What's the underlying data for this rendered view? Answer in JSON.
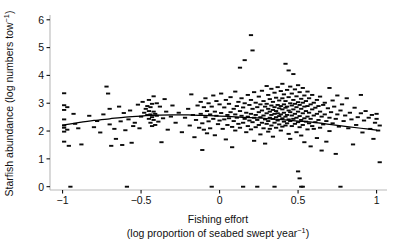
{
  "chart_data": {
    "type": "scatter",
    "title": "",
    "xlabel_line1": "Fishing effort",
    "xlabel_line2_pre": "(log proportion of seabed swept year",
    "xlabel_line2_sup": "−1",
    "xlabel_line2_post": ")",
    "ylabel_pre": "Starfish abundance (log numbers tow",
    "ylabel_sup": "−1",
    "ylabel_post": ")",
    "xlim": [
      -1.08,
      1.06
    ],
    "ylim": [
      -0.12,
      6.1
    ],
    "xticks": [
      -1,
      -0.5,
      0,
      0.5,
      1
    ],
    "xticklabels": [
      "−1",
      "−0.5",
      "0",
      "0.5",
      "1"
    ],
    "yticks": [
      0,
      1,
      2,
      3,
      4,
      5,
      6
    ],
    "yticklabels": [
      "0",
      "1",
      "2",
      "3",
      "4",
      "5",
      "6"
    ],
    "grid": false,
    "legend": "none",
    "marker_style": "horizontal-dash",
    "marker_color": "#0b0b0b",
    "axis_color": "#b9b9b9",
    "curve_color": "#000000",
    "fit_curve_note": "smooth fitted line: rises from ~2.2 at x=-1 to a shallow peak ~2.6 near x=-0.25 then declines to ~2.0 at x=1",
    "fit_curve": [
      [
        -1.0,
        2.21
      ],
      [
        -0.9,
        2.3
      ],
      [
        -0.8,
        2.38
      ],
      [
        -0.7,
        2.44
      ],
      [
        -0.6,
        2.5
      ],
      [
        -0.5,
        2.54
      ],
      [
        -0.4,
        2.57
      ],
      [
        -0.3,
        2.58
      ],
      [
        -0.2,
        2.58
      ],
      [
        -0.1,
        2.56
      ],
      [
        0.0,
        2.54
      ],
      [
        0.1,
        2.51
      ],
      [
        0.2,
        2.48
      ],
      [
        0.3,
        2.45
      ],
      [
        0.4,
        2.41
      ],
      [
        0.5,
        2.36
      ],
      [
        0.6,
        2.31
      ],
      [
        0.7,
        2.24
      ],
      [
        0.8,
        2.17
      ],
      [
        0.9,
        2.1
      ],
      [
        1.0,
        2.03
      ]
    ],
    "points": [
      [
        -0.99,
        3.36
      ],
      [
        -0.99,
        2.93
      ],
      [
        -0.99,
        2.76
      ],
      [
        -0.99,
        2.42
      ],
      [
        -0.99,
        2.2
      ],
      [
        -0.99,
        2.12
      ],
      [
        -0.99,
        1.98
      ],
      [
        -0.99,
        1.62
      ],
      [
        -0.97,
        2.86
      ],
      [
        -0.97,
        2.05
      ],
      [
        -0.96,
        1.47
      ],
      [
        -0.95,
        0.0
      ],
      [
        -0.93,
        2.62
      ],
      [
        -0.92,
        2.26
      ],
      [
        -0.9,
        2.1
      ],
      [
        -0.88,
        1.52
      ],
      [
        -0.83,
        2.55
      ],
      [
        -0.8,
        2.14
      ],
      [
        -0.78,
        2.36
      ],
      [
        -0.76,
        1.95
      ],
      [
        -0.74,
        2.6
      ],
      [
        -0.72,
        3.6
      ],
      [
        -0.71,
        3.35
      ],
      [
        -0.7,
        2.8
      ],
      [
        -0.7,
        2.24
      ],
      [
        -0.69,
        1.47
      ],
      [
        -0.67,
        2.08
      ],
      [
        -0.66,
        1.72
      ],
      [
        -0.64,
        2.88
      ],
      [
        -0.63,
        2.35
      ],
      [
        -0.62,
        1.5
      ],
      [
        -0.61,
        2.65
      ],
      [
        -0.6,
        2.03
      ],
      [
        -0.59,
        0.0
      ],
      [
        -0.58,
        2.42
      ],
      [
        -0.57,
        2.74
      ],
      [
        -0.56,
        1.58
      ],
      [
        -0.55,
        2.18
      ],
      [
        -0.54,
        2.3
      ],
      [
        -0.52,
        2.95
      ],
      [
        -0.51,
        2.1
      ],
      [
        -0.5,
        2.52
      ],
      [
        -0.49,
        3.05
      ],
      [
        -0.48,
        2.66
      ],
      [
        -0.47,
        2.8
      ],
      [
        -0.46,
        2.9
      ],
      [
        -0.46,
        2.58
      ],
      [
        -0.45,
        3.12
      ],
      [
        -0.45,
        2.72
      ],
      [
        -0.45,
        2.44
      ],
      [
        -0.44,
        2.86
      ],
      [
        -0.44,
        2.6
      ],
      [
        -0.44,
        2.3
      ],
      [
        -0.43,
        2.98
      ],
      [
        -0.43,
        2.5
      ],
      [
        -0.43,
        2.18
      ],
      [
        -0.42,
        3.25
      ],
      [
        -0.42,
        2.7
      ],
      [
        -0.42,
        2.4
      ],
      [
        -0.41,
        2.62
      ],
      [
        -0.41,
        2.22
      ],
      [
        -0.4,
        3.0
      ],
      [
        -0.4,
        2.55
      ],
      [
        -0.39,
        2.34
      ],
      [
        -0.38,
        2.88
      ],
      [
        -0.37,
        1.6
      ],
      [
        -0.36,
        2.46
      ],
      [
        -0.35,
        3.15
      ],
      [
        -0.34,
        2.7
      ],
      [
        -0.33,
        2.05
      ],
      [
        -0.31,
        2.52
      ],
      [
        -0.3,
        2.92
      ],
      [
        -0.28,
        2.3
      ],
      [
        -0.26,
        2.66
      ],
      [
        -0.24,
        1.96
      ],
      [
        -0.22,
        2.48
      ],
      [
        -0.2,
        2.8
      ],
      [
        -0.19,
        2.2
      ],
      [
        -0.18,
        3.32
      ],
      [
        -0.17,
        2.58
      ],
      [
        -0.16,
        1.78
      ],
      [
        -0.15,
        2.4
      ],
      [
        -0.14,
        2.92
      ],
      [
        -0.13,
        2.12
      ],
      [
        -0.12,
        3.05
      ],
      [
        -0.12,
        2.62
      ],
      [
        -0.11,
        2.28
      ],
      [
        -0.11,
        1.32
      ],
      [
        -0.1,
        2.86
      ],
      [
        -0.1,
        2.05
      ],
      [
        -0.09,
        3.18
      ],
      [
        -0.09,
        2.5
      ],
      [
        -0.08,
        2.72
      ],
      [
        -0.08,
        1.92
      ],
      [
        -0.07,
        3.0
      ],
      [
        -0.07,
        2.35
      ],
      [
        -0.06,
        2.6
      ],
      [
        -0.06,
        2.1
      ],
      [
        -0.05,
        2.88
      ],
      [
        -0.05,
        0.0
      ],
      [
        -0.04,
        3.28
      ],
      [
        -0.04,
        2.44
      ],
      [
        -0.03,
        2.7
      ],
      [
        -0.03,
        1.85
      ],
      [
        -0.02,
        3.08
      ],
      [
        -0.02,
        2.55
      ],
      [
        -0.01,
        2.25
      ],
      [
        0.0,
        2.96
      ],
      [
        0.0,
        2.38
      ],
      [
        0.01,
        3.35
      ],
      [
        0.01,
        2.65
      ],
      [
        0.02,
        2.08
      ],
      [
        0.03,
        2.85
      ],
      [
        0.03,
        2.42
      ],
      [
        0.04,
        3.12
      ],
      [
        0.04,
        1.7
      ],
      [
        0.05,
        2.58
      ],
      [
        0.05,
        2.22
      ],
      [
        0.06,
        2.98
      ],
      [
        0.06,
        2.46
      ],
      [
        0.07,
        3.22
      ],
      [
        0.07,
        2.68
      ],
      [
        0.08,
        2.15
      ],
      [
        0.08,
        1.42
      ],
      [
        0.09,
        2.8
      ],
      [
        0.09,
        2.36
      ],
      [
        0.1,
        3.42
      ],
      [
        0.1,
        2.6
      ],
      [
        0.1,
        2.02
      ],
      [
        0.11,
        2.9
      ],
      [
        0.11,
        2.48
      ],
      [
        0.12,
        3.05
      ],
      [
        0.12,
        2.26
      ],
      [
        0.13,
        4.28
      ],
      [
        0.13,
        2.72
      ],
      [
        0.13,
        2.12
      ],
      [
        0.14,
        3.18
      ],
      [
        0.14,
        2.55
      ],
      [
        0.15,
        2.85
      ],
      [
        0.15,
        2.3
      ],
      [
        0.15,
        0.0
      ],
      [
        0.16,
        4.55
      ],
      [
        0.16,
        3.0
      ],
      [
        0.16,
        2.44
      ],
      [
        0.17,
        2.66
      ],
      [
        0.17,
        1.96
      ],
      [
        0.18,
        3.3
      ],
      [
        0.18,
        2.52
      ],
      [
        0.18,
        2.18
      ],
      [
        0.19,
        2.94
      ],
      [
        0.19,
        2.38
      ],
      [
        0.2,
        5.45
      ],
      [
        0.2,
        3.12
      ],
      [
        0.2,
        2.62
      ],
      [
        0.2,
        2.06
      ],
      [
        0.21,
        4.9
      ],
      [
        0.21,
        2.8
      ],
      [
        0.21,
        2.32
      ],
      [
        0.22,
        3.4
      ],
      [
        0.22,
        2.48
      ],
      [
        0.22,
        1.65
      ],
      [
        0.23,
        3.02
      ],
      [
        0.23,
        2.58
      ],
      [
        0.23,
        2.14
      ],
      [
        0.24,
        2.86
      ],
      [
        0.24,
        2.4
      ],
      [
        0.24,
        0.0
      ],
      [
        0.25,
        3.24
      ],
      [
        0.25,
        2.68
      ],
      [
        0.25,
        2.22
      ],
      [
        0.26,
        2.96
      ],
      [
        0.26,
        2.5
      ],
      [
        0.26,
        1.88
      ],
      [
        0.27,
        3.45
      ],
      [
        0.27,
        2.74
      ],
      [
        0.27,
        2.3
      ],
      [
        0.28,
        3.08
      ],
      [
        0.28,
        2.56
      ],
      [
        0.28,
        2.1
      ],
      [
        0.29,
        2.88
      ],
      [
        0.29,
        2.42
      ],
      [
        0.29,
        1.55
      ],
      [
        0.3,
        3.62
      ],
      [
        0.3,
        2.98
      ],
      [
        0.3,
        2.64
      ],
      [
        0.3,
        2.26
      ],
      [
        0.31,
        3.3
      ],
      [
        0.31,
        2.8
      ],
      [
        0.31,
        2.36
      ],
      [
        0.31,
        1.98
      ],
      [
        0.32,
        3.15
      ],
      [
        0.32,
        2.7
      ],
      [
        0.32,
        2.48
      ],
      [
        0.32,
        2.08
      ],
      [
        0.33,
        3.52
      ],
      [
        0.33,
        2.92
      ],
      [
        0.33,
        2.58
      ],
      [
        0.33,
        2.2
      ],
      [
        0.34,
        3.05
      ],
      [
        0.34,
        2.76
      ],
      [
        0.34,
        2.44
      ],
      [
        0.34,
        1.8
      ],
      [
        0.35,
        3.38
      ],
      [
        0.35,
        2.86
      ],
      [
        0.35,
        2.62
      ],
      [
        0.35,
        2.3
      ],
      [
        0.35,
        0.0
      ],
      [
        0.36,
        3.2
      ],
      [
        0.36,
        2.72
      ],
      [
        0.36,
        2.5
      ],
      [
        0.36,
        2.12
      ],
      [
        0.37,
        3.58
      ],
      [
        0.37,
        2.94
      ],
      [
        0.37,
        2.64
      ],
      [
        0.37,
        2.38
      ],
      [
        0.38,
        3.1
      ],
      [
        0.38,
        2.82
      ],
      [
        0.38,
        2.54
      ],
      [
        0.38,
        2.24
      ],
      [
        0.39,
        3.44
      ],
      [
        0.39,
        2.9
      ],
      [
        0.39,
        2.6
      ],
      [
        0.39,
        2.02
      ],
      [
        0.4,
        3.7
      ],
      [
        0.4,
        3.18
      ],
      [
        0.4,
        2.78
      ],
      [
        0.4,
        2.46
      ],
      [
        0.4,
        2.16
      ],
      [
        0.41,
        3.32
      ],
      [
        0.41,
        2.96
      ],
      [
        0.41,
        2.66
      ],
      [
        0.41,
        2.34
      ],
      [
        0.42,
        4.42
      ],
      [
        0.42,
        3.08
      ],
      [
        0.42,
        2.84
      ],
      [
        0.42,
        2.52
      ],
      [
        0.42,
        2.2
      ],
      [
        0.43,
        3.48
      ],
      [
        0.43,
        2.88
      ],
      [
        0.43,
        2.58
      ],
      [
        0.43,
        2.28
      ],
      [
        0.44,
        4.18
      ],
      [
        0.44,
        3.22
      ],
      [
        0.44,
        2.74
      ],
      [
        0.44,
        2.42
      ],
      [
        0.44,
        1.9
      ],
      [
        0.45,
        3.6
      ],
      [
        0.45,
        3.0
      ],
      [
        0.45,
        2.68
      ],
      [
        0.45,
        2.36
      ],
      [
        0.45,
        1.72
      ],
      [
        0.46,
        3.35
      ],
      [
        0.46,
        2.92
      ],
      [
        0.46,
        2.56
      ],
      [
        0.46,
        2.18
      ],
      [
        0.47,
        4.05
      ],
      [
        0.47,
        3.12
      ],
      [
        0.47,
        2.78
      ],
      [
        0.47,
        2.44
      ],
      [
        0.48,
        3.5
      ],
      [
        0.48,
        2.98
      ],
      [
        0.48,
        2.62
      ],
      [
        0.48,
        2.26
      ],
      [
        0.49,
        3.25
      ],
      [
        0.49,
        2.86
      ],
      [
        0.49,
        2.48
      ],
      [
        0.49,
        1.96
      ],
      [
        0.5,
        3.65
      ],
      [
        0.5,
        3.04
      ],
      [
        0.5,
        2.7
      ],
      [
        0.5,
        2.32
      ],
      [
        0.5,
        0.55
      ],
      [
        0.51,
        3.4
      ],
      [
        0.51,
        2.94
      ],
      [
        0.51,
        2.54
      ],
      [
        0.51,
        2.14
      ],
      [
        0.51,
        0.3
      ],
      [
        0.52,
        3.16
      ],
      [
        0.52,
        2.8
      ],
      [
        0.52,
        2.4
      ],
      [
        0.52,
        1.84
      ],
      [
        0.52,
        0.0
      ],
      [
        0.53,
        3.55
      ],
      [
        0.53,
        3.02
      ],
      [
        0.53,
        2.64
      ],
      [
        0.53,
        2.22
      ],
      [
        0.53,
        0.0
      ],
      [
        0.54,
        3.28
      ],
      [
        0.54,
        2.88
      ],
      [
        0.54,
        2.46
      ],
      [
        0.54,
        1.6
      ],
      [
        0.55,
        3.08
      ],
      [
        0.55,
        2.72
      ],
      [
        0.55,
        2.34
      ],
      [
        0.56,
        3.42
      ],
      [
        0.56,
        2.9
      ],
      [
        0.56,
        2.52
      ],
      [
        0.56,
        2.06
      ],
      [
        0.57,
        3.18
      ],
      [
        0.57,
        2.66
      ],
      [
        0.57,
        2.28
      ],
      [
        0.58,
        2.96
      ],
      [
        0.58,
        2.44
      ],
      [
        0.58,
        1.45
      ],
      [
        0.59,
        3.3
      ],
      [
        0.59,
        2.78
      ],
      [
        0.59,
        2.18
      ],
      [
        0.6,
        3.02
      ],
      [
        0.6,
        2.56
      ],
      [
        0.6,
        2.08
      ],
      [
        0.61,
        2.84
      ],
      [
        0.61,
        2.32
      ],
      [
        0.62,
        3.12
      ],
      [
        0.62,
        2.62
      ],
      [
        0.62,
        1.75
      ],
      [
        0.63,
        2.9
      ],
      [
        0.63,
        2.4
      ],
      [
        0.64,
        3.24
      ],
      [
        0.64,
        2.7
      ],
      [
        0.64,
        2.12
      ],
      [
        0.65,
        2.52
      ],
      [
        0.65,
        1.3
      ],
      [
        0.66,
        2.94
      ],
      [
        0.66,
        2.24
      ],
      [
        0.67,
        3.02
      ],
      [
        0.67,
        2.6
      ],
      [
        0.68,
        2.36
      ],
      [
        0.68,
        1.62
      ],
      [
        0.69,
        2.82
      ],
      [
        0.7,
        3.55
      ],
      [
        0.7,
        2.48
      ],
      [
        0.7,
        2.0
      ],
      [
        0.71,
        2.68
      ],
      [
        0.72,
        3.1
      ],
      [
        0.72,
        2.28
      ],
      [
        0.73,
        2.88
      ],
      [
        0.74,
        2.44
      ],
      [
        0.74,
        1.18
      ],
      [
        0.75,
        3.28
      ],
      [
        0.75,
        2.6
      ],
      [
        0.76,
        2.16
      ],
      [
        0.77,
        2.74
      ],
      [
        0.77,
        0.0
      ],
      [
        0.78,
        2.96
      ],
      [
        0.79,
        2.36
      ],
      [
        0.8,
        2.56
      ],
      [
        0.81,
        3.18
      ],
      [
        0.82,
        2.1
      ],
      [
        0.83,
        2.66
      ],
      [
        0.84,
        2.42
      ],
      [
        0.85,
        1.52
      ],
      [
        0.86,
        2.84
      ],
      [
        0.87,
        2.22
      ],
      [
        0.88,
        2.5
      ],
      [
        0.9,
        3.3
      ],
      [
        0.9,
        2.64
      ],
      [
        0.91,
        1.95
      ],
      [
        0.92,
        2.38
      ],
      [
        0.93,
        2.72
      ],
      [
        0.95,
        2.48
      ],
      [
        0.96,
        2.08
      ],
      [
        0.97,
        2.58
      ],
      [
        0.98,
        1.72
      ],
      [
        0.99,
        2.3
      ],
      [
        1.0,
        2.62
      ],
      [
        1.0,
        2.44
      ],
      [
        1.01,
        2.02
      ],
      [
        1.02,
        2.2
      ],
      [
        1.02,
        0.88
      ]
    ]
  }
}
